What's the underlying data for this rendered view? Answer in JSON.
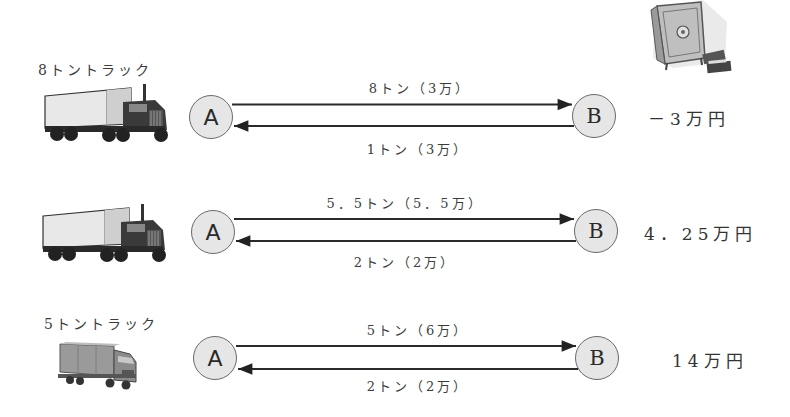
{
  "rows": [
    {
      "truck_label": "8トントラック",
      "truck_icon": "semi-truck-icon",
      "node_a": "A",
      "node_b": "B",
      "forward_label": "8トン（3万）",
      "return_label": "1トン（3万）",
      "result": "－3万円"
    },
    {
      "truck_label": "",
      "truck_icon": "semi-truck-icon",
      "node_a": "A",
      "node_b": "B",
      "forward_label": "5．5トン（5．5万）",
      "return_label": "2トン（2万）",
      "result": "4．25万円"
    },
    {
      "truck_label": "5トントラック",
      "truck_icon": "box-truck-icon",
      "node_a": "A",
      "node_b": "B",
      "forward_label": "5トン（6万）",
      "return_label": "2トン（2万）",
      "result": "14万円"
    }
  ],
  "decorations": {
    "safe_icon": "safe-with-money-icon"
  },
  "colors": {
    "node_fill": "#e6e6e6",
    "node_border": "#6a6a6a",
    "line": "#2a2a2a",
    "text": "#3c3c3c"
  }
}
